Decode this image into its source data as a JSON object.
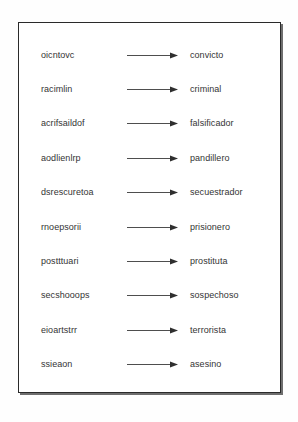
{
  "figure": {
    "kind": "word-unscramble-worksheet",
    "arrow_icon": "right-arrow-icon",
    "frame_color": "#2a2a2a",
    "text_color": "#343434",
    "background_color": "#ffffff"
  },
  "rows": [
    {
      "scrambled": "oicntovc",
      "solution": "convicto"
    },
    {
      "scrambled": "racimlin",
      "solution": "criminal"
    },
    {
      "scrambled": "acrifsaildof",
      "solution": "falsificador"
    },
    {
      "scrambled": "aodlienlrp",
      "solution": "pandillero"
    },
    {
      "scrambled": "dsrescuretoa",
      "solution": "secuestrador"
    },
    {
      "scrambled": "rnoepsorii",
      "solution": "prisionero"
    },
    {
      "scrambled": "postttuari",
      "solution": "prostituta"
    },
    {
      "scrambled": "secshooops",
      "solution": "sospechoso"
    },
    {
      "scrambled": "eioartstrr",
      "solution": "terrorista"
    },
    {
      "scrambled": "ssieaon",
      "solution": "asesino"
    }
  ]
}
